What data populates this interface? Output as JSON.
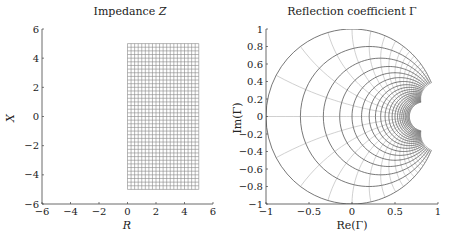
{
  "chart_data": [
    {
      "type": "line",
      "title": "Impedance Z",
      "xlabel": "R",
      "ylabel": "X",
      "xlim": [
        -6,
        6
      ],
      "ylim": [
        -6,
        6
      ],
      "xticks": [
        -6,
        -4,
        -2,
        0,
        2,
        4,
        6
      ],
      "yticks": [
        -6,
        -4,
        -2,
        0,
        2,
        4,
        6
      ],
      "xtick_labels": [
        "−6",
        "−4",
        "−2",
        "0",
        "2",
        "4",
        "6"
      ],
      "ytick_labels": [
        "−6",
        "−4",
        "−2",
        "0",
        "2",
        "4",
        "6"
      ],
      "grid": false,
      "description": "Rectangular mesh of constant-R and constant-X lines",
      "mesh": {
        "R_range": [
          0,
          5
        ],
        "X_range": [
          -5,
          5
        ],
        "step": 0.25
      },
      "line_color": "#888888"
    },
    {
      "type": "line",
      "title": "Reflection coefficient Γ",
      "xlabel": "Re(Γ)",
      "ylabel": "Im(Γ)",
      "xlim": [
        -1,
        1
      ],
      "ylim": [
        -1,
        1
      ],
      "xticks": [
        -1,
        -0.5,
        0,
        0.5,
        1
      ],
      "yticks": [
        -1,
        -0.8,
        -0.6,
        -0.4,
        -0.2,
        0,
        0.2,
        0.4,
        0.6,
        0.8,
        1
      ],
      "xtick_labels": [
        "−1",
        "−0.5",
        "0",
        "0.5",
        "1"
      ],
      "ytick_labels": [
        "−1",
        "−0.8",
        "−0.6",
        "−0.4",
        "−0.2",
        "0",
        "0.2",
        "0.4",
        "0.6",
        "0.8",
        "1"
      ],
      "grid": false,
      "description": "Mesh mapped through Γ = (Z−1)/(Z+1): constant-R circles (dark) and constant-X arcs (light)",
      "series": [
        {
          "name": "constant R circles",
          "R_values": [
            0,
            0.25,
            0.5,
            0.75,
            1,
            1.25,
            1.5,
            1.75,
            2,
            2.25,
            2.5,
            2.75,
            3,
            3.25,
            3.5,
            3.75,
            4,
            4.25,
            4.5,
            4.75,
            5
          ],
          "color": "#555555"
        },
        {
          "name": "constant X arcs",
          "X_values": [
            -5,
            -4.75,
            -4.5,
            -4.25,
            -4,
            -3.75,
            -3.5,
            -3.25,
            -3,
            -2.75,
            -2.5,
            -2.25,
            -2,
            -1.75,
            -1.5,
            -1.25,
            -1,
            -0.75,
            -0.5,
            -0.25,
            0,
            0.25,
            0.5,
            0.75,
            1,
            1.25,
            1.5,
            1.75,
            2,
            2.25,
            2.5,
            2.75,
            3,
            3.25,
            3.5,
            3.75,
            4,
            4.25,
            4.5,
            4.75,
            5
          ],
          "color": "#bbbbbb"
        }
      ]
    }
  ],
  "left": {
    "title_prefix": "Impedance ",
    "title_var": "Z",
    "xlabel": "R",
    "ylabel": "X"
  },
  "right": {
    "title": "Reflection coefficient Γ",
    "xlabel": "Re(Γ)",
    "ylabel": "Im(Γ)"
  }
}
